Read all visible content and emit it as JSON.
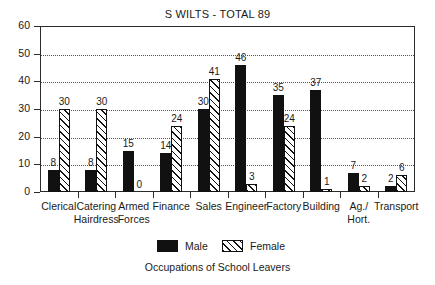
{
  "chart_data": {
    "type": "bar",
    "title": "S WILTS - TOTAL 89",
    "xlabel": "Occupations of School Leavers",
    "ylabel": "",
    "ylim": [
      0,
      60
    ],
    "ytick_step": 10,
    "ytick_labels": [
      "0",
      "10",
      "20",
      "30",
      "40",
      "50",
      "60"
    ],
    "grid": "horizontal-dotted",
    "legend_position": "below-axes",
    "categories": [
      "Clerical",
      "Catering Hairdress",
      "Armed Forces",
      "Finance",
      "Sales",
      "Engineer",
      "Factory",
      "Building",
      "Ag./ Hort.",
      "Transport"
    ],
    "category_label_lines": [
      [
        "Clerical"
      ],
      [
        "Catering",
        "Hairdress"
      ],
      [
        "Armed",
        "Forces"
      ],
      [
        "Finance"
      ],
      [
        "Sales"
      ],
      [
        "Engineer"
      ],
      [
        "Factory"
      ],
      [
        "Building"
      ],
      [
        "Ag./",
        "Hort."
      ],
      [
        "Transport"
      ]
    ],
    "series": [
      {
        "name": "Male",
        "color": "#111111",
        "pattern": "solid",
        "values": [
          8,
          8,
          15,
          14,
          30,
          46,
          35,
          37,
          7,
          2
        ]
      },
      {
        "name": "Female",
        "color": "#111111",
        "pattern": "diagonal-hatch",
        "values": [
          30,
          30,
          0,
          24,
          41,
          3,
          24,
          1,
          2,
          6
        ]
      }
    ]
  },
  "legend": {
    "items": [
      {
        "label": "Male",
        "swatch": "solid-black-swatch"
      },
      {
        "label": "Female",
        "swatch": "hatched-swatch"
      }
    ]
  }
}
